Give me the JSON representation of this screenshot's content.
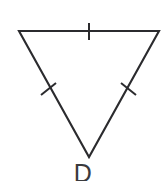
{
  "figure": {
    "kind": "geometry-diagram",
    "shape_name": "triangle",
    "orientation": "inverted",
    "background_color": "#ffffff",
    "stroke_color": "#2b2b2e",
    "stroke_width": 2.1,
    "label_color": "#3a3a3d",
    "vertices": {
      "top_left": {
        "x": 19,
        "y": 31
      },
      "top_right": {
        "x": 159,
        "y": 31
      },
      "bottom": {
        "x": 89,
        "y": 157
      }
    },
    "path": "M 19 31 L 159 31 L 89 157 Z",
    "sides": [
      {
        "name": "top-side",
        "from": "top_left",
        "to": "top_right",
        "tick_count": 1,
        "tick": {
          "x1": 89,
          "y1": 23,
          "x2": 89,
          "y2": 40
        }
      },
      {
        "name": "left-side",
        "from": "top_left",
        "to": "bottom",
        "tick_count": 1,
        "tick": {
          "x1": 41,
          "y1": 95,
          "x2": 56,
          "y2": 83
        }
      },
      {
        "name": "right-side",
        "from": "top_right",
        "to": "bottom",
        "tick_count": 1,
        "tick": {
          "x1": 121,
          "y1": 83,
          "x2": 136,
          "y2": 95
        }
      }
    ],
    "labels": [
      {
        "name": "vertex-label-D",
        "text": "D",
        "position": "below-bottom-vertex",
        "clipped_at_bottom": true
      }
    ]
  }
}
